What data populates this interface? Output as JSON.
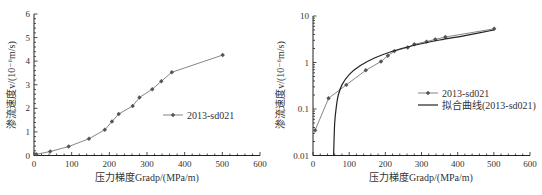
{
  "chart_data": [
    {
      "type": "line",
      "title": "",
      "xlabel": "压力梯度Gradp/(MPa/m)",
      "ylabel": "渗流速度v/(10⁻⁶m/s)",
      "xlim": [
        0,
        600
      ],
      "ylim": [
        0,
        6
      ],
      "yscale": "linear",
      "grid": false,
      "legend_position": "center-right",
      "x_ticks": [
        "0",
        "100",
        "200",
        "300",
        "400",
        "500",
        "600"
      ],
      "y_ticks": [
        "0",
        "1",
        "2",
        "3",
        "4",
        "5",
        "6"
      ],
      "series": [
        {
          "name": "2013-sd021",
          "marker": "diamond",
          "x": [
            6,
            43,
            92,
            146,
            188,
            207,
            225,
            262,
            280,
            314,
            338,
            366,
            501
          ],
          "y": [
            0.05,
            0.17,
            0.38,
            0.71,
            1.09,
            1.44,
            1.76,
            2.1,
            2.46,
            2.81,
            3.15,
            3.53,
            4.26
          ]
        }
      ]
    },
    {
      "type": "line",
      "title": "",
      "xlabel": "压力梯度Gradp/(MPa/m)",
      "ylabel": "渗流速度v/(10⁻⁶m/s)",
      "xlim": [
        0,
        600
      ],
      "ylim": [
        0.01,
        10
      ],
      "yscale": "log",
      "grid": false,
      "legend_position": "center-right",
      "x_ticks": [
        "0",
        "100",
        "200",
        "300",
        "400",
        "500",
        "600"
      ],
      "y_ticks": [
        "0.01",
        "0.1",
        "1",
        "10"
      ],
      "series": [
        {
          "name": "2013-sd021",
          "marker": "diamond",
          "x": [
            6,
            43,
            92,
            146,
            188,
            207,
            225,
            262,
            280,
            314,
            338,
            366,
            501
          ],
          "y": [
            0.035,
            0.17,
            0.33,
            0.68,
            1.05,
            1.4,
            1.76,
            2.1,
            2.46,
            2.81,
            3.15,
            3.53,
            5.3
          ]
        },
        {
          "name": "拟合曲线(2013-sd021)",
          "marker": "none",
          "x": [
            57,
            60,
            65,
            70,
            80,
            100,
            130,
            170,
            220,
            280,
            350,
            420,
            500
          ],
          "y": [
            0.01,
            0.05,
            0.12,
            0.2,
            0.33,
            0.55,
            0.85,
            1.25,
            1.75,
            2.35,
            3.05,
            3.8,
            5.0
          ]
        }
      ]
    }
  ],
  "legend": {
    "left": [
      "2013-sd021"
    ],
    "right": [
      "2013-sd021",
      "拟合曲线(2013-sd021)"
    ]
  },
  "axes": {
    "xlabel": "压力梯度Gradp/(MPa/m)",
    "ylabel": "渗流速度v/(10⁻⁶m/s)"
  },
  "colors": {
    "series_line": "#777777",
    "marker": "#555555",
    "fit_line": "#222222",
    "axis": "#222222"
  }
}
